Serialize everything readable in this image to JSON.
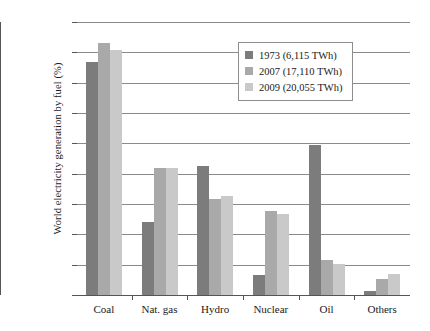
{
  "chart_data": {
    "type": "bar",
    "title": "",
    "xlabel": "",
    "ylabel": "World electricity generation by fuel (%)",
    "categories": [
      "Coal",
      "Nat. gas",
      "Hydro",
      "Nuclear",
      "Oil",
      "Others"
    ],
    "series": [
      {
        "name": "1973 (6,115 TWh)",
        "color": "#7c7c7c",
        "values": [
          38.4,
          12.1,
          21.2,
          3.3,
          24.8,
          0.6
        ]
      },
      {
        "name": "2007 (17,110 TWh)",
        "color": "#a9a9a9",
        "values": [
          41.6,
          21.0,
          15.9,
          13.9,
          5.8,
          2.7
        ]
      },
      {
        "name": "2009 (20,055 TWh)",
        "color": "#c9c9c9",
        "values": [
          40.4,
          21.0,
          16.3,
          13.4,
          5.1,
          3.4
        ]
      }
    ],
    "ylim": [
      0,
      45
    ],
    "ytick_values": [
      0,
      5,
      10,
      15,
      20,
      25,
      30,
      35,
      40,
      45
    ],
    "ytick_labels": [
      "0.0%",
      "5.0%",
      "10.0%",
      "15.0%",
      "20.0%",
      "25.0%",
      "30.0%",
      "35.0%",
      "40.0%",
      "45.0%"
    ],
    "grid": true,
    "legend_position": "upper-center",
    "axis_color": "#555555",
    "grid_color": "#8a8a8a",
    "background": "#ffffff"
  }
}
